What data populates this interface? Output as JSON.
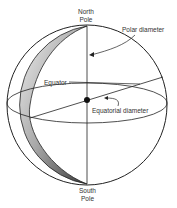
{
  "diagram": {
    "type": "globe-schematic",
    "labels": {
      "north_pole": [
        "North",
        "Pole"
      ],
      "south_pole": [
        "South",
        "Pole"
      ],
      "polar_diameter": "Polar diameter",
      "equator": "Equator",
      "equatorial_diameter": "Equatorial diameter"
    },
    "colors": {
      "outline": "#222222",
      "shade_dark": "#3a3a3a",
      "shade_light": "#e8e8e8",
      "text": "#333333"
    }
  }
}
